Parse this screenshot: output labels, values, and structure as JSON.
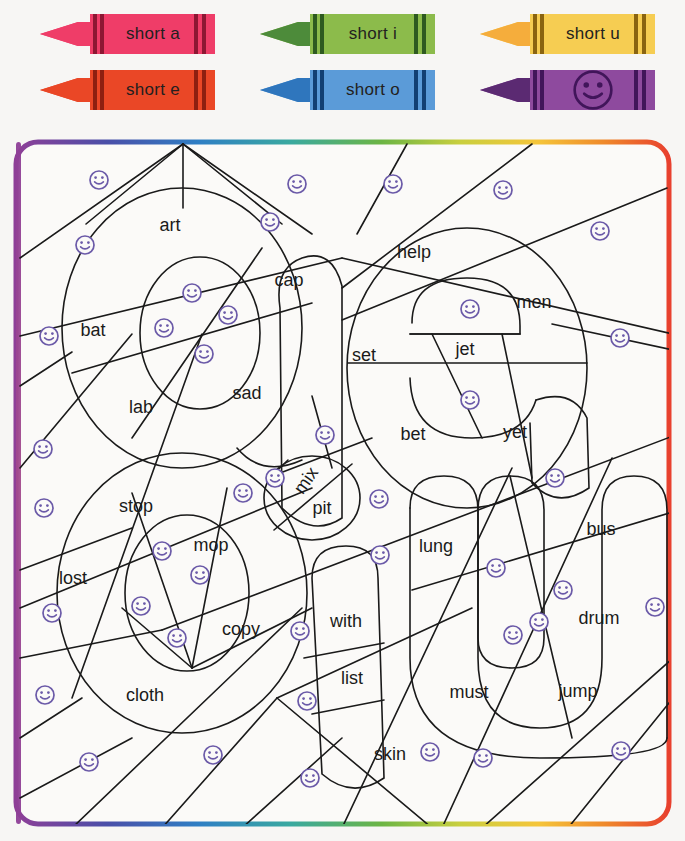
{
  "worksheet": {
    "background_color": "#f7f6f4",
    "ink_color": "#1a1a1a",
    "smiley_color": "#6b5aa8",
    "border_gradient": [
      "#8e3f97",
      "#4a4fa8",
      "#2f7fc4",
      "#3aa9a0",
      "#6cb544",
      "#c9cf3f",
      "#f5c53a",
      "#ef8a2b",
      "#e8402e"
    ]
  },
  "legend": {
    "title": "crayon-key",
    "crayons": [
      {
        "id": "crayon-short-a",
        "label": "short a",
        "body": "#ef3d68",
        "tip": "#ef3d68",
        "stripe": "#8d1733",
        "smiley": false
      },
      {
        "id": "crayon-short-e",
        "label": "short e",
        "body": "#ea4726",
        "tip": "#ea4726",
        "stripe": "#8e1f10",
        "smiley": false
      },
      {
        "id": "crayon-short-i",
        "label": "short i",
        "body": "#8cbb4b",
        "tip": "#4d8b3a",
        "stripe": "#2e5a20",
        "smiley": false
      },
      {
        "id": "crayon-short-o",
        "label": "short o",
        "body": "#5b9bd8",
        "tip": "#2f76bd",
        "stripe": "#123f72",
        "smiley": false
      },
      {
        "id": "crayon-short-u",
        "label": "short u",
        "body": "#f6cd52",
        "tip": "#f5ad3c",
        "stripe": "#8a6410",
        "smiley": false
      },
      {
        "id": "crayon-purple-smile",
        "label": "",
        "body": "#8e4a9e",
        "tip": "#5b2a72",
        "stripe": "#41155a",
        "smiley": true
      }
    ]
  },
  "puzzle": {
    "name": "color-by-short-vowel-picture",
    "words": [
      {
        "text": "art",
        "x": 158,
        "y": 88,
        "rot": 0
      },
      {
        "text": "cap",
        "x": 277,
        "y": 143,
        "rot": 0
      },
      {
        "text": "bat",
        "x": 81,
        "y": 193,
        "rot": 0
      },
      {
        "text": "lab",
        "x": 129,
        "y": 270,
        "rot": 0
      },
      {
        "text": "sad",
        "x": 235,
        "y": 256,
        "rot": 0
      },
      {
        "text": "help",
        "x": 402,
        "y": 115,
        "rot": 0
      },
      {
        "text": "men",
        "x": 522,
        "y": 165,
        "rot": 0
      },
      {
        "text": "set",
        "x": 352,
        "y": 218,
        "rot": 0
      },
      {
        "text": "jet",
        "x": 453,
        "y": 212,
        "rot": 0
      },
      {
        "text": "bet",
        "x": 401,
        "y": 297,
        "rot": 0
      },
      {
        "text": "yet",
        "x": 503,
        "y": 295,
        "rot": 0
      },
      {
        "text": "mix",
        "x": 295,
        "y": 343,
        "rot": -55
      },
      {
        "text": "pit",
        "x": 310,
        "y": 371,
        "rot": 0
      },
      {
        "text": "stop",
        "x": 124,
        "y": 369,
        "rot": 0
      },
      {
        "text": "mop",
        "x": 199,
        "y": 408,
        "rot": 0
      },
      {
        "text": "lost",
        "x": 61,
        "y": 441,
        "rot": 0
      },
      {
        "text": "copy",
        "x": 229,
        "y": 492,
        "rot": 0
      },
      {
        "text": "cloth",
        "x": 133,
        "y": 558,
        "rot": 0
      },
      {
        "text": "with",
        "x": 334,
        "y": 484,
        "rot": 0
      },
      {
        "text": "list",
        "x": 340,
        "y": 541,
        "rot": 0
      },
      {
        "text": "skin",
        "x": 378,
        "y": 617,
        "rot": 0
      },
      {
        "text": "lung",
        "x": 424,
        "y": 409,
        "rot": 0
      },
      {
        "text": "bus",
        "x": 589,
        "y": 392,
        "rot": 0
      },
      {
        "text": "must",
        "x": 457,
        "y": 555,
        "rot": 0
      },
      {
        "text": "drum",
        "x": 587,
        "y": 481,
        "rot": 0
      },
      {
        "text": "jump",
        "x": 566,
        "y": 554,
        "rot": 0
      }
    ],
    "smileys": [
      {
        "x": 77,
        "y": 32
      },
      {
        "x": 275,
        "y": 36
      },
      {
        "x": 371,
        "y": 36
      },
      {
        "x": 481,
        "y": 42
      },
      {
        "x": 63,
        "y": 97
      },
      {
        "x": 248,
        "y": 74
      },
      {
        "x": 578,
        "y": 83
      },
      {
        "x": 170,
        "y": 145
      },
      {
        "x": 448,
        "y": 161
      },
      {
        "x": 27,
        "y": 188
      },
      {
        "x": 206,
        "y": 167
      },
      {
        "x": 598,
        "y": 190
      },
      {
        "x": 142,
        "y": 180
      },
      {
        "x": 182,
        "y": 206
      },
      {
        "x": 448,
        "y": 252
      },
      {
        "x": 21,
        "y": 301
      },
      {
        "x": 303,
        "y": 287
      },
      {
        "x": 533,
        "y": 330
      },
      {
        "x": 22,
        "y": 360
      },
      {
        "x": 221,
        "y": 345
      },
      {
        "x": 357,
        "y": 351
      },
      {
        "x": 253,
        "y": 330
      },
      {
        "x": 358,
        "y": 407
      },
      {
        "x": 541,
        "y": 442
      },
      {
        "x": 140,
        "y": 403
      },
      {
        "x": 178,
        "y": 427
      },
      {
        "x": 633,
        "y": 459
      },
      {
        "x": 119,
        "y": 458
      },
      {
        "x": 155,
        "y": 490
      },
      {
        "x": 474,
        "y": 420
      },
      {
        "x": 491,
        "y": 487
      },
      {
        "x": 30,
        "y": 465
      },
      {
        "x": 278,
        "y": 483
      },
      {
        "x": 285,
        "y": 553
      },
      {
        "x": 517,
        "y": 474
      },
      {
        "x": 23,
        "y": 547
      },
      {
        "x": 191,
        "y": 607
      },
      {
        "x": 288,
        "y": 630
      },
      {
        "x": 408,
        "y": 604
      },
      {
        "x": 461,
        "y": 610
      },
      {
        "x": 599,
        "y": 603
      },
      {
        "x": 67,
        "y": 614
      }
    ]
  }
}
